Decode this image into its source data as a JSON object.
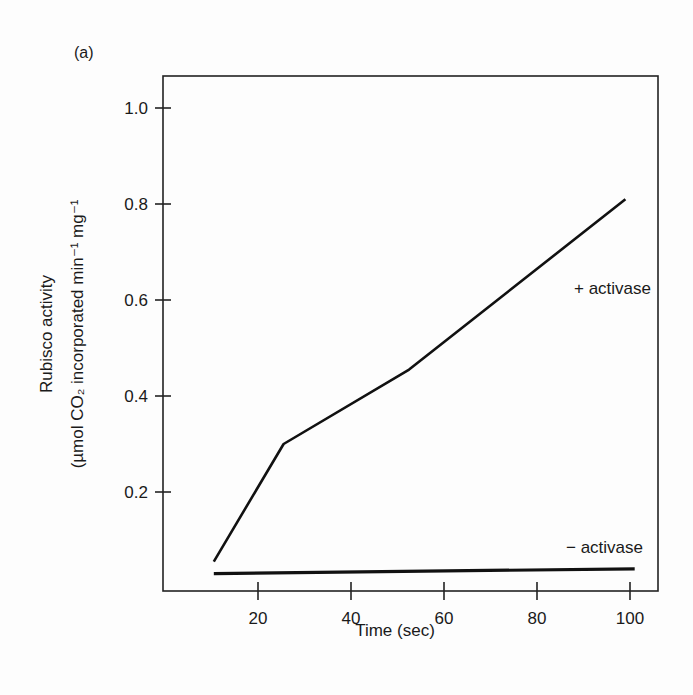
{
  "panel_label": "(a)",
  "chart_data": {
    "type": "line",
    "title": "",
    "xlabel": "Time (sec)",
    "ylabel_line1": "Rubisco activity",
    "ylabel_line2": "(µmol CO₂ incorporated min⁻¹ mg⁻¹",
    "xlim": [
      0,
      105
    ],
    "ylim": [
      0,
      1.05
    ],
    "xticks": [
      20,
      40,
      60,
      80,
      100
    ],
    "yticks": [
      0.2,
      0.4,
      0.6,
      0.8,
      1.0
    ],
    "xtick_labels": [
      "20",
      "40",
      "60",
      "80",
      "100"
    ],
    "ytick_labels": [
      "0.2",
      "0.4",
      "0.6",
      "0.8",
      "1.0"
    ],
    "grid": false,
    "legend": "inline labels",
    "series": [
      {
        "name": "+ activase",
        "x": [
          10.5,
          25.5,
          52.5,
          99
        ],
        "y": [
          0.055,
          0.3,
          0.455,
          0.81
        ]
      },
      {
        "name": "− activase",
        "x": [
          10.5,
          101
        ],
        "y": [
          0.03,
          0.04
        ]
      }
    ]
  }
}
